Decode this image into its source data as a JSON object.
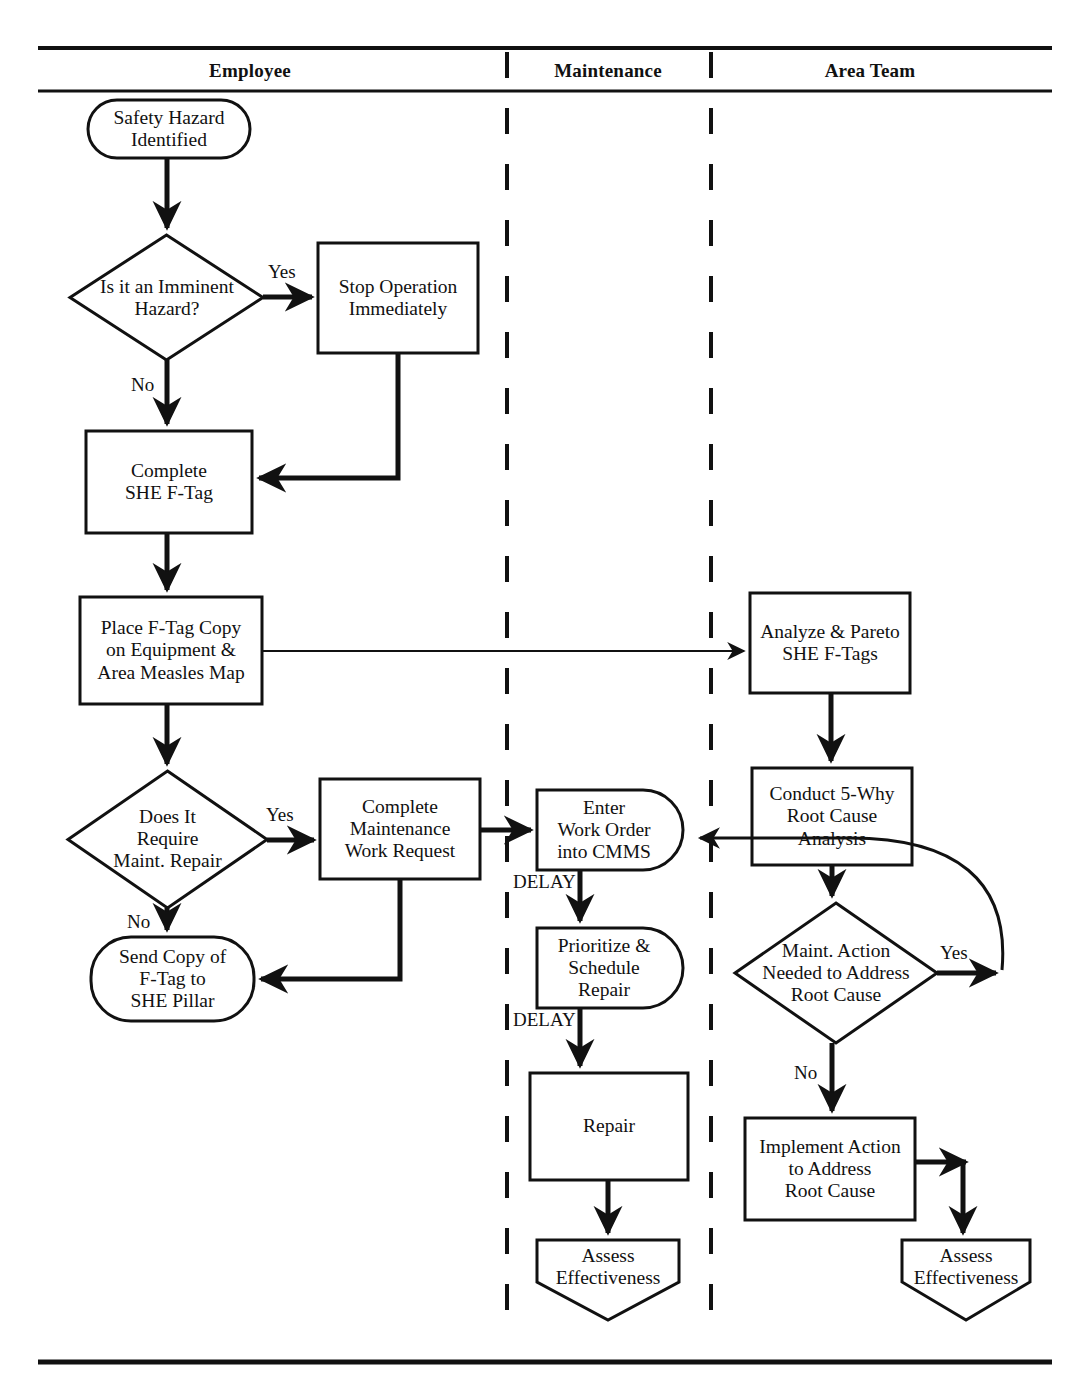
{
  "diagram": {
    "type": "swimlane-flowchart",
    "canvas": {
      "width": 1090,
      "height": 1380
    },
    "colors": {
      "stroke": "#111111",
      "fill": "#ffffff",
      "background": "#ffffff"
    },
    "frame": {
      "top_rule_y": 48,
      "header_rule_y": 91,
      "bottom_rule_y": 1362,
      "left_x": 38,
      "right_x": 1052
    },
    "lanes": [
      {
        "id": "employee",
        "label": "Employee",
        "x_start": 38,
        "x_end": 507,
        "header_center_x": 250
      },
      {
        "id": "maintenance",
        "label": "Maintenance",
        "x_start": 507,
        "x_end": 711,
        "header_center_x": 608
      },
      {
        "id": "area_team",
        "label": "Area Team",
        "x_start": 711,
        "x_end": 1052,
        "header_center_x": 870
      }
    ],
    "lane_dividers": [
      {
        "x": 507,
        "style": "dashed"
      },
      {
        "x": 711,
        "style": "dashed"
      }
    ],
    "nodes": [
      {
        "id": "safety_hazard_identified",
        "lane": "employee",
        "shape": "stadium",
        "label": "Safety Hazard\nIdentified",
        "x": 88,
        "y": 100,
        "w": 162,
        "h": 58
      },
      {
        "id": "imminent_hazard_q",
        "lane": "employee",
        "shape": "diamond",
        "label": "Is it an Imminent\nHazard?",
        "x": 70,
        "y": 235,
        "w": 193,
        "h": 125
      },
      {
        "id": "stop_operation",
        "lane": "employee",
        "shape": "rectangle",
        "label": "Stop Operation\nImmediately",
        "x": 318,
        "y": 243,
        "w": 160,
        "h": 110
      },
      {
        "id": "complete_she_ftag",
        "lane": "employee",
        "shape": "rectangle",
        "label": "Complete\nSHE F-Tag",
        "x": 86,
        "y": 431,
        "w": 166,
        "h": 102
      },
      {
        "id": "place_ftag_copy",
        "lane": "employee",
        "shape": "rectangle",
        "label": "Place F-Tag Copy\non Equipment &\nArea Measles Map",
        "x": 80,
        "y": 597,
        "w": 182,
        "h": 107
      },
      {
        "id": "require_maint_repair_q",
        "lane": "employee",
        "shape": "diamond",
        "label": "Does It\nRequire\nMaint. Repair",
        "x": 68,
        "y": 771,
        "w": 199,
        "h": 137
      },
      {
        "id": "complete_maint_work_request",
        "lane": "employee",
        "shape": "rectangle",
        "label": "Complete\nMaintenance\nWork Request",
        "x": 320,
        "y": 779,
        "w": 160,
        "h": 100
      },
      {
        "id": "send_copy_ftag_she_pillar",
        "lane": "employee",
        "shape": "stadium",
        "label": "Send Copy of\nF-Tag to\nSHE Pillar",
        "x": 91,
        "y": 937,
        "w": 163,
        "h": 84
      },
      {
        "id": "enter_work_order_cmms",
        "lane": "maintenance",
        "shape": "d-shape",
        "label": "Enter\nWork Order\ninto CMMS",
        "x": 537,
        "y": 790,
        "w": 146,
        "h": 80
      },
      {
        "id": "prioritize_schedule_repair",
        "lane": "maintenance",
        "shape": "d-shape",
        "label": "Prioritize &\nSchedule\nRepair",
        "x": 537,
        "y": 928,
        "w": 146,
        "h": 80
      },
      {
        "id": "repair",
        "lane": "maintenance",
        "shape": "rectangle",
        "label": "Repair",
        "x": 530,
        "y": 1073,
        "w": 158,
        "h": 107
      },
      {
        "id": "assess_effectiveness_maintenance",
        "lane": "maintenance",
        "shape": "pentagon-down",
        "label": "Assess\nEffectiveness",
        "x": 537,
        "y": 1240,
        "w": 142,
        "h": 70
      },
      {
        "id": "analyze_pareto_she_ftags",
        "lane": "area_team",
        "shape": "rectangle",
        "label": "Analyze & Pareto\nSHE F-Tags",
        "x": 750,
        "y": 593,
        "w": 160,
        "h": 100
      },
      {
        "id": "conduct_5why_root_cause",
        "lane": "area_team",
        "shape": "rectangle",
        "label": "Conduct 5-Why\nRoot Cause\nAnalysis",
        "x": 752,
        "y": 768,
        "w": 160,
        "h": 97
      },
      {
        "id": "maint_action_needed_q",
        "lane": "area_team",
        "shape": "diamond",
        "label": "Maint. Action\nNeeded to Address\nRoot Cause",
        "x": 735,
        "y": 903,
        "w": 202,
        "h": 140
      },
      {
        "id": "implement_action_root_cause",
        "lane": "area_team",
        "shape": "rectangle",
        "label": "Implement Action\nto Address\nRoot Cause",
        "x": 745,
        "y": 1118,
        "w": 170,
        "h": 102
      },
      {
        "id": "assess_effectiveness_area_team",
        "lane": "area_team",
        "shape": "pentagon-down",
        "label": "Assess\nEffectiveness",
        "x": 902,
        "y": 1240,
        "w": 128,
        "h": 70
      }
    ],
    "edges": [
      {
        "id": "e1",
        "from": "safety_hazard_identified",
        "to": "imminent_hazard_q",
        "label": ""
      },
      {
        "id": "e2",
        "from": "imminent_hazard_q",
        "to": "stop_operation",
        "label": "Yes",
        "label_x": 268,
        "label_y": 268
      },
      {
        "id": "e3",
        "from": "imminent_hazard_q",
        "to": "complete_she_ftag",
        "label": "No",
        "label_x": 131,
        "label_y": 378
      },
      {
        "id": "e4",
        "from": "stop_operation",
        "to": "complete_she_ftag",
        "label": ""
      },
      {
        "id": "e5",
        "from": "complete_she_ftag",
        "to": "place_ftag_copy",
        "label": ""
      },
      {
        "id": "e6",
        "from": "place_ftag_copy",
        "to": "analyze_pareto_she_ftags",
        "label": ""
      },
      {
        "id": "e7",
        "from": "place_ftag_copy",
        "to": "require_maint_repair_q",
        "label": ""
      },
      {
        "id": "e8",
        "from": "require_maint_repair_q",
        "to": "complete_maint_work_request",
        "label": "Yes",
        "label_x": 268,
        "label_y": 814
      },
      {
        "id": "e9",
        "from": "require_maint_repair_q",
        "to": "send_copy_ftag_she_pillar",
        "label": "No",
        "label_x": 131,
        "label_y": 915
      },
      {
        "id": "e10",
        "from": "complete_maint_work_request",
        "to": "send_copy_ftag_she_pillar",
        "label": ""
      },
      {
        "id": "e11",
        "from": "complete_maint_work_request",
        "to": "enter_work_order_cmms",
        "label": ""
      },
      {
        "id": "e12",
        "from": "enter_work_order_cmms",
        "to": "prioritize_schedule_repair",
        "label": "DELAY",
        "label_x": 524,
        "label_y": 883
      },
      {
        "id": "e13",
        "from": "prioritize_schedule_repair",
        "to": "repair",
        "label": "DELAY",
        "label_x": 524,
        "label_y": 1021
      },
      {
        "id": "e14",
        "from": "repair",
        "to": "assess_effectiveness_maintenance",
        "label": ""
      },
      {
        "id": "e15",
        "from": "analyze_pareto_she_ftags",
        "to": "conduct_5why_root_cause",
        "label": ""
      },
      {
        "id": "e16",
        "from": "conduct_5why_root_cause",
        "to": "maint_action_needed_q",
        "label": ""
      },
      {
        "id": "e17",
        "from": "maint_action_needed_q",
        "to": "enter_work_order_cmms",
        "label": "Yes",
        "label_x": 948,
        "label_y": 956,
        "style": "curved-feedback"
      },
      {
        "id": "e18",
        "from": "maint_action_needed_q",
        "to": "implement_action_root_cause",
        "label": "No",
        "label_x": 800,
        "label_y": 1077
      },
      {
        "id": "e19",
        "from": "implement_action_root_cause",
        "to": "assess_effectiveness_area_team",
        "label": ""
      }
    ]
  }
}
